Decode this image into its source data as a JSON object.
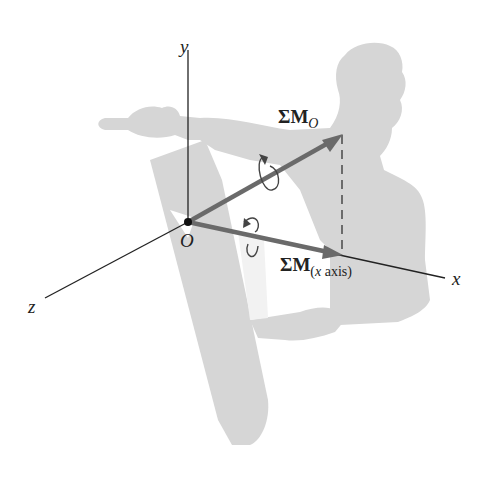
{
  "figure": {
    "axes": {
      "x_label": "x",
      "y_label": "y",
      "z_label": "z",
      "origin_label": "O"
    },
    "vectors": [
      {
        "name": "moment-about-origin",
        "symbol": "ΣM",
        "subscript": "O"
      },
      {
        "name": "moment-about-x-axis",
        "symbol": "ΣM",
        "subscript_italic": "x",
        "subscript_rest": " axis",
        "subscript_open": "(",
        "subscript_close": ")"
      }
    ],
    "colors": {
      "silhouette": "#d6d6d6",
      "vector": "#6a6a6a",
      "axis": "#222222",
      "background": "#ffffff"
    }
  }
}
